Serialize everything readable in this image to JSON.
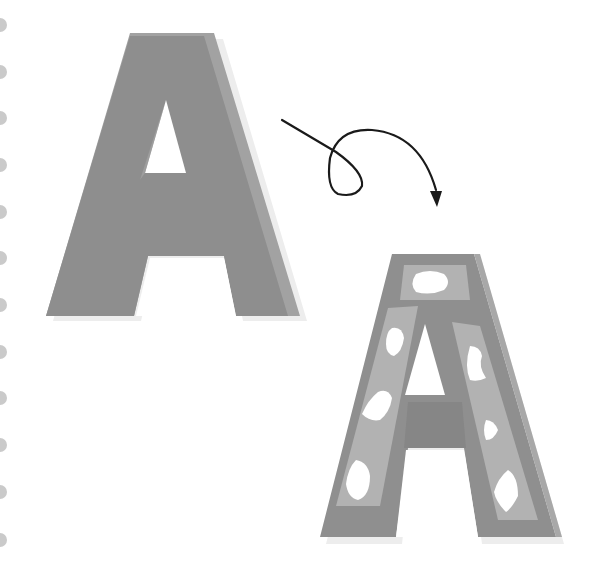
{
  "illustration": {
    "subject": "Letter A transformation",
    "letter": "A",
    "colors": {
      "background": "#ffffff",
      "binder_hole": "#c8c8c8",
      "letter_dark": "#8f8f8f",
      "letter_mid": "#9e9e9e",
      "letter_light": "#b4b4b4",
      "letter_shadow": "#e8e8e8",
      "hole": "#ffffff",
      "arrow": "#1a1a1a"
    },
    "binder_holes": {
      "count": 12,
      "y_positions": [
        25,
        72,
        118,
        165,
        212,
        258,
        305,
        352,
        398,
        445,
        492,
        540
      ]
    },
    "plain_letter": {
      "label": "Plain A"
    },
    "decorated_letter": {
      "label": "Decorated A with spots"
    },
    "arrow": {
      "label": "Transformation arrow with loop"
    }
  }
}
